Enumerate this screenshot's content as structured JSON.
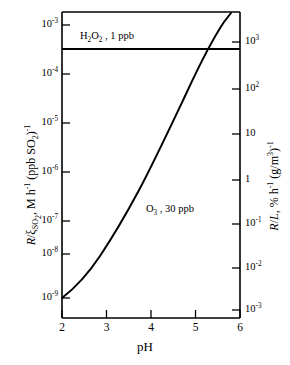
{
  "chart_data": {
    "type": "line",
    "title": "",
    "xlabel": "pH",
    "ylabel_left_html": "<i>R</i>/&xi;<sub>SO<sub>2</sub></sub>,  M h<sup>-1</sup> (ppb SO<sub>2</sub>)<sup>-1</sup>",
    "ylabel_right_html": "<i>R</i>/<i>L</i>, % h<sup>-1</sup> (g/m<sup>3</sup>)<sup>-1</sup>",
    "xlim": [
      2,
      6
    ],
    "xticks": [
      "2",
      "3",
      "4",
      "5",
      "6"
    ],
    "xtick_values": [
      2,
      3,
      4,
      5,
      6
    ],
    "left_axis": {
      "scale": "log",
      "direction": "decreasing-downward",
      "ticks_html": [
        "10<sup>-3</sup>",
        "10<sup>-4</sup>",
        "10<sup>-5</sup>",
        "10<sup>-6</sup>",
        "10<sup>-7</sup>",
        "10<sup>-8</sup>",
        "10<sup>-9</sup>"
      ],
      "tick_exponents": [
        -3,
        -4,
        -5,
        -6,
        -7,
        -8,
        -9
      ],
      "lim": [
        1e-09,
        0.001
      ]
    },
    "right_axis": {
      "scale": "log",
      "direction": "decreasing-downward",
      "ticks_html": [
        "10<sup>3</sup>",
        "10<sup>2</sup>",
        "10",
        "1",
        "10<sup>-1</sup>",
        "10<sup>-2</sup>",
        "10<sup>-3</sup>"
      ],
      "tick_exponents": [
        3,
        2,
        1,
        0,
        -1,
        -2,
        -3
      ],
      "lim": [
        0.001,
        3000
      ]
    },
    "grid": false,
    "legend": "inline-annotations",
    "series": [
      {
        "name": "H2O2 , 1 ppb",
        "label_html": "H<sub>2</sub>O<sub>2</sub> , 1 ppb",
        "style": "solid-horizontal",
        "x": [
          2,
          2.5,
          3,
          3.5,
          4,
          4.5,
          5,
          5.5,
          6
        ],
        "y_left": [
          0.00032,
          0.00032,
          0.00032,
          0.00032,
          0.00032,
          0.00032,
          0.00032,
          0.00032,
          0.00032
        ],
        "y_right": [
          800,
          800,
          800,
          800,
          800,
          800,
          800,
          800,
          800
        ]
      },
      {
        "name": "O3 , 30 ppb",
        "label_html": "O<sub>3</sub> , 30 ppb",
        "style": "solid-curve",
        "x": [
          2.0,
          2.25,
          2.5,
          2.75,
          3.0,
          3.25,
          3.5,
          3.75,
          4.0,
          4.25,
          4.5,
          4.75,
          5.0,
          5.25,
          5.5,
          5.75,
          6.0
        ],
        "y_left": [
          1.4e-09,
          1e-09,
          7e-10,
          4.6e-10,
          3e-10,
          1.9e-10,
          1.2e-10,
          7e-11,
          4e-11,
          2.2e-11,
          1.2e-11,
          6e-12,
          3e-12,
          1.5e-12,
          7e-13,
          3e-13,
          1.3e-13
        ],
        "y_right": [
          0.0035,
          0.005,
          0.0072,
          0.011,
          0.017,
          0.027,
          0.042,
          0.072,
          0.125,
          0.23,
          0.42,
          0.85,
          1.7,
          3.4,
          7.3,
          17,
          40
        ]
      }
    ],
    "annotations": [
      {
        "id": "h2o2",
        "text_html": "H<sub>2</sub>O<sub>2</sub> , 1 ppb",
        "x": 2.45,
        "y_left": 0.0011
      },
      {
        "id": "o3",
        "text_html": "O<sub>3</sub> , 30 ppb",
        "x": 4.0,
        "y_left": 1.2e-07
      }
    ],
    "colors": {
      "axis": "#000000",
      "curve": "#000000",
      "background": "#ffffff"
    }
  },
  "labels": {
    "x_axis_title": "pH",
    "left_ticks": [
      "10-3",
      "10-4",
      "10-5",
      "10-6",
      "10-7",
      "10-8",
      "10-9"
    ],
    "right_ticks": [
      "10 3",
      "10 2",
      "10",
      "1",
      "10-1",
      "10-2",
      "10-3"
    ],
    "x_ticks": [
      "2",
      "3",
      "4",
      "5",
      "6"
    ]
  }
}
